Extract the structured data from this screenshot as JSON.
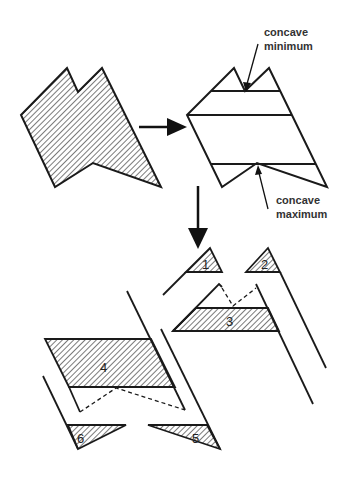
{
  "annotations": {
    "concave_minimum": {
      "line1": "concave",
      "line2": "minimum"
    },
    "concave_maximum": {
      "line1": "concave",
      "line2": "maximum"
    }
  },
  "regions": [
    {
      "id": "1",
      "label": "1"
    },
    {
      "id": "2",
      "label": "2"
    },
    {
      "id": "3",
      "label": "3"
    },
    {
      "id": "4",
      "label": "4"
    },
    {
      "id": "5",
      "label": "5"
    },
    {
      "id": "6",
      "label": "6"
    }
  ],
  "colors": {
    "stroke": "#1a1a1a",
    "hatch": "#333333",
    "background": "#ffffff"
  }
}
